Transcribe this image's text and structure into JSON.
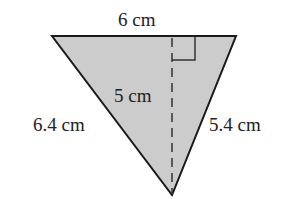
{
  "diagram": {
    "type": "triangle",
    "fill_color": "#cccccc",
    "stroke_color": "#1a1a1a",
    "vertices": {
      "top_left": [
        52,
        36
      ],
      "top_right": [
        236,
        36
      ],
      "bottom": [
        172,
        195
      ]
    },
    "altitude": {
      "from": [
        172,
        36
      ],
      "to": [
        172,
        195
      ],
      "style": "dashed"
    },
    "right_angle_marker": {
      "x": 172,
      "y": 36,
      "size": 23
    },
    "labels": {
      "top_side": "6 cm",
      "height": "5 cm",
      "left_side": "6.4 cm",
      "right_side": "5.4 cm"
    }
  }
}
